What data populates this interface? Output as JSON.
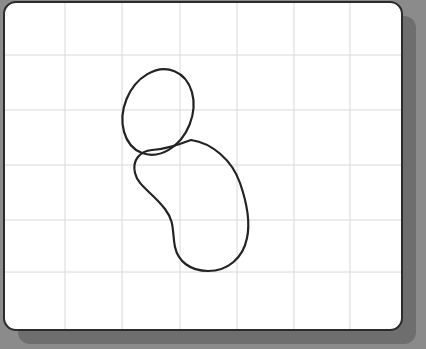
{
  "app": {
    "title": "Whiteboard Drawing Canvas",
    "surface_label": "whiteboard",
    "background_color": "#8b8b8b",
    "board_color": "#ffffff",
    "board_border_color": "#2b2b2b",
    "shadow_color": "#6e6e6e",
    "grid_color": "#d8d8d8",
    "ink_color": "#232323"
  },
  "board": {
    "x": 4,
    "y": 2,
    "width": 398,
    "height": 328,
    "corner_radius": 12,
    "border_width": 2,
    "shadow_offset_x": 14,
    "shadow_offset_y": 14
  },
  "grid": {
    "visible": true,
    "vertical_lines": [
      65,
      122,
      180,
      237,
      294,
      350
    ],
    "horizontal_lines": [
      55,
      110,
      165,
      220,
      272
    ],
    "line_width": 1
  },
  "drawing": {
    "stroke_color": "#232323",
    "stroke_width": 2.2,
    "fill": "none",
    "shapes": [
      {
        "name": "ellipse-head",
        "type": "ellipse",
        "cx": 158,
        "cy": 112,
        "rx": 34,
        "ry": 44,
        "rotation_deg": 22
      },
      {
        "name": "bean-body",
        "type": "closed-path",
        "bounds": {
          "left": 134,
          "top": 140,
          "right": 249,
          "bottom": 271
        },
        "path": "M 191 140 C 212 143 232 160 240 183 C 248 206 250 224 247 238 C 243 258 228 271 208 271 C 190 271 178 261 175 247 C 172 232 175 222 165 209 C 152 192 138 186 135 173 C 132 160 140 151 152 150 C 166 149 177 145 191 140 Z"
      }
    ]
  },
  "toolbar": {
    "visible": false
  }
}
